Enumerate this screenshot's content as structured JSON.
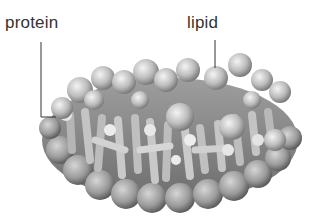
{
  "labels": {
    "protein": "protein",
    "lipid": "lipid"
  },
  "colors": {
    "label_text": "#333333",
    "leader_line": "#333333",
    "sphere_light": "#f2f2f2",
    "sphere_dark": "#8a8a8a",
    "background": "#ffffff"
  }
}
